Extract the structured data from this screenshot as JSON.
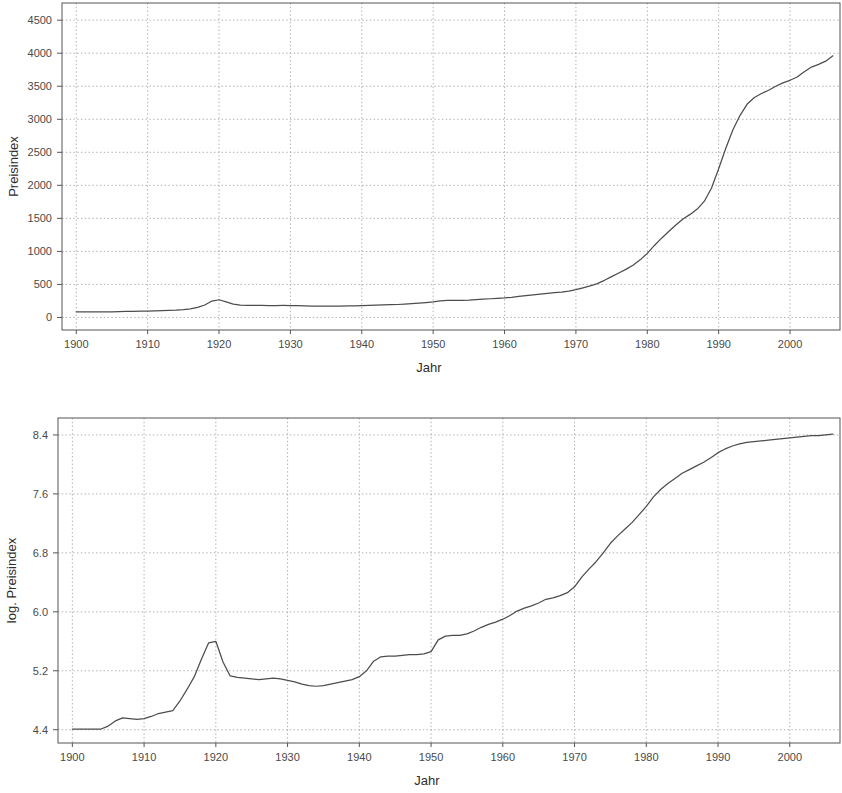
{
  "figure": {
    "background": "#ffffff",
    "line_color": "#4d4d4d",
    "grid_color": "#9a9a9a",
    "axis_color": "#555555"
  },
  "panels": {
    "top": {
      "ylabel": "Preisindex",
      "xlabel": "Jahr",
      "x_ticks": [
        "1900",
        "1910",
        "1920",
        "1930",
        "1940",
        "1950",
        "1960",
        "1970",
        "1980",
        "1990",
        "2000"
      ],
      "y_ticks": [
        "0",
        "500",
        "1000",
        "1500",
        "2000",
        "2500",
        "3000",
        "3500",
        "4000",
        "4500"
      ]
    },
    "bottom": {
      "ylabel": "log. Preisindex",
      "xlabel": "Jahr",
      "x_ticks": [
        "1900",
        "1910",
        "1920",
        "1930",
        "1940",
        "1950",
        "1960",
        "1970",
        "1980",
        "1990",
        "2000"
      ],
      "y_ticks": [
        "4.4",
        "5.2",
        "6.0",
        "6.8",
        "7.6",
        "8.4"
      ]
    }
  },
  "chart_data": [
    {
      "type": "line",
      "title": "",
      "panel": "top",
      "xlabel": "Jahr",
      "ylabel": "Preisindex",
      "xlim": [
        1898,
        2007
      ],
      "ylim": [
        -190,
        4760
      ],
      "xticks": [
        1900,
        1910,
        1920,
        1930,
        1940,
        1950,
        1960,
        1970,
        1980,
        1990,
        2000
      ],
      "yticks": [
        0,
        500,
        1000,
        1500,
        2000,
        2500,
        3000,
        3500,
        4000,
        4500
      ],
      "grid": true,
      "legend": null,
      "series": [
        {
          "name": "Preisindex",
          "x": [
            1900,
            1901,
            1902,
            1903,
            1904,
            1905,
            1906,
            1907,
            1908,
            1909,
            1910,
            1911,
            1912,
            1913,
            1914,
            1915,
            1916,
            1917,
            1918,
            1919,
            1920,
            1921,
            1922,
            1923,
            1924,
            1925,
            1926,
            1927,
            1928,
            1929,
            1930,
            1931,
            1932,
            1933,
            1934,
            1935,
            1936,
            1937,
            1938,
            1939,
            1940,
            1941,
            1942,
            1943,
            1944,
            1945,
            1946,
            1947,
            1948,
            1949,
            1950,
            1951,
            1952,
            1953,
            1954,
            1955,
            1956,
            1957,
            1958,
            1959,
            1960,
            1961,
            1962,
            1963,
            1964,
            1965,
            1966,
            1967,
            1968,
            1969,
            1970,
            1971,
            1972,
            1973,
            1974,
            1975,
            1976,
            1977,
            1978,
            1979,
            1980,
            1981,
            1982,
            1983,
            1984,
            1985,
            1986,
            1987,
            1988,
            1989,
            1990,
            1991,
            1992,
            1993,
            1994,
            1995,
            1996,
            1997,
            1998,
            1999,
            2000,
            2001,
            2002,
            2003,
            2004,
            2005,
            2006
          ],
          "y": [
            83,
            83,
            83,
            84,
            84,
            86,
            89,
            92,
            93,
            95,
            97,
            100,
            104,
            107,
            110,
            118,
            131,
            152,
            188,
            248,
            268,
            236,
            203,
            188,
            184,
            182,
            181,
            180,
            180,
            181,
            180,
            178,
            175,
            172,
            170,
            170,
            172,
            173,
            174,
            176,
            179,
            182,
            186,
            190,
            193,
            196,
            202,
            209,
            217,
            226,
            236,
            252,
            259,
            259,
            258,
            261,
            268,
            276,
            283,
            289,
            295,
            305,
            318,
            330,
            340,
            352,
            366,
            376,
            385,
            400,
            420,
            448,
            478,
            512,
            562,
            618,
            672,
            728,
            790,
            872,
            970,
            1090,
            1200,
            1300,
            1400,
            1490,
            1560,
            1640,
            1760,
            1960,
            2250,
            2560,
            2840,
            3060,
            3230,
            3330,
            3390,
            3440,
            3500,
            3550,
            3590,
            3640,
            3720,
            3790,
            3830,
            3880,
            3960,
            4050,
            4140
          ]
        }
      ]
    },
    {
      "type": "line",
      "title": "",
      "panel": "bottom",
      "xlabel": "Jahr",
      "ylabel": "log. Preisindex",
      "xlim": [
        1898,
        2007
      ],
      "ylim": [
        4.22,
        8.63
      ],
      "xticks": [
        1900,
        1910,
        1920,
        1930,
        1940,
        1950,
        1960,
        1970,
        1980,
        1990,
        2000
      ],
      "yticks": [
        4.4,
        5.2,
        6.0,
        6.8,
        7.6,
        8.4
      ],
      "grid": true,
      "legend": null,
      "series": [
        {
          "name": "log. Preisindex",
          "x": [
            1900,
            1901,
            1902,
            1903,
            1904,
            1905,
            1906,
            1907,
            1908,
            1909,
            1910,
            1911,
            1912,
            1913,
            1914,
            1915,
            1916,
            1917,
            1918,
            1919,
            1920,
            1921,
            1922,
            1923,
            1924,
            1925,
            1926,
            1927,
            1928,
            1929,
            1930,
            1931,
            1932,
            1933,
            1934,
            1935,
            1936,
            1937,
            1938,
            1939,
            1940,
            1941,
            1942,
            1943,
            1944,
            1945,
            1946,
            1947,
            1948,
            1949,
            1950,
            1951,
            1952,
            1953,
            1954,
            1955,
            1956,
            1957,
            1958,
            1959,
            1960,
            1961,
            1962,
            1963,
            1964,
            1965,
            1966,
            1967,
            1968,
            1969,
            1970,
            1971,
            1972,
            1973,
            1974,
            1975,
            1976,
            1977,
            1978,
            1979,
            1980,
            1981,
            1982,
            1983,
            1984,
            1985,
            1986,
            1987,
            1988,
            1989,
            1990,
            1991,
            1992,
            1993,
            1994,
            1995,
            1996,
            1997,
            1998,
            1999,
            2000,
            2001,
            2002,
            2003,
            2004,
            2005,
            2006
          ],
          "y": [
            4.41,
            4.41,
            4.41,
            4.41,
            4.41,
            4.45,
            4.52,
            4.56,
            4.55,
            4.54,
            4.55,
            4.58,
            4.62,
            4.64,
            4.66,
            4.79,
            4.95,
            5.12,
            5.36,
            5.58,
            5.6,
            5.32,
            5.13,
            5.11,
            5.1,
            5.09,
            5.08,
            5.09,
            5.1,
            5.09,
            5.07,
            5.05,
            5.02,
            5.0,
            4.99,
            5.0,
            5.02,
            5.04,
            5.06,
            5.08,
            5.12,
            5.2,
            5.33,
            5.39,
            5.4,
            5.4,
            5.41,
            5.42,
            5.42,
            5.43,
            5.46,
            5.62,
            5.67,
            5.68,
            5.68,
            5.7,
            5.74,
            5.79,
            5.83,
            5.86,
            5.9,
            5.95,
            6.01,
            6.05,
            6.08,
            6.12,
            6.17,
            6.19,
            6.22,
            6.26,
            6.34,
            6.47,
            6.58,
            6.68,
            6.8,
            6.93,
            7.03,
            7.12,
            7.21,
            7.32,
            7.43,
            7.56,
            7.66,
            7.74,
            7.81,
            7.88,
            7.93,
            7.98,
            8.03,
            8.09,
            8.16,
            8.21,
            8.25,
            8.28,
            8.3,
            8.31,
            8.32,
            8.33,
            8.34,
            8.35,
            8.36,
            8.37,
            8.38,
            8.39,
            8.39,
            8.4,
            8.41
          ]
        }
      ]
    }
  ]
}
